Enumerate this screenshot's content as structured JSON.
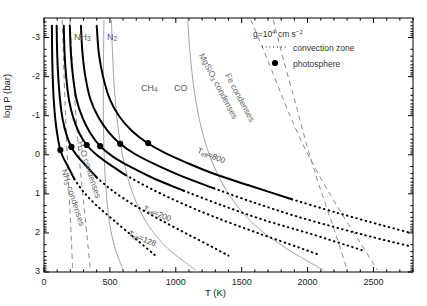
{
  "chart_data": {
    "type": "line",
    "title": "",
    "xlabel": "T (K)",
    "ylabel": "log P (bar)",
    "xlim": [
      0,
      2800
    ],
    "ylim": [
      -3.5,
      3.0
    ],
    "y_inverted": true,
    "grid": false,
    "xticks": [
      0,
      500,
      1000,
      1500,
      2000,
      2500
    ],
    "xticklabels": [
      "0",
      "500",
      "1000",
      "1500",
      "2000",
      "2500"
    ],
    "yticks": [
      -3,
      -2,
      -1,
      0,
      1,
      2,
      3
    ],
    "yticklabels": [
      "-3",
      "-2",
      "-1",
      "0",
      "1",
      "2",
      "3"
    ],
    "legend": {
      "position": "top-right",
      "gravity": "g=10⁴ cm s⁻²",
      "entries": [
        {
          "label": "convection zone",
          "style": "dotted",
          "color": "#000000"
        },
        {
          "label": "photosphere",
          "style": "marker-filled-circle",
          "color": "#000000"
        }
      ]
    },
    "series": [
      {
        "name": "T_eff=128 profile",
        "style": "solid+dotted",
        "label": "Tₑ꜀=128",
        "points": [
          [
            60,
            -3.3
          ],
          [
            62,
            -2.6
          ],
          [
            66,
            -2.0
          ],
          [
            74,
            -1.4
          ],
          [
            86,
            -0.9
          ],
          [
            104,
            -0.45
          ],
          [
            124,
            -0.12
          ],
          [
            150,
            0.1
          ],
          [
            182,
            0.3
          ],
          [
            230,
            0.62
          ],
          [
            300,
            0.95
          ],
          [
            400,
            1.3
          ],
          [
            520,
            1.65
          ],
          [
            660,
            2.05
          ],
          [
            800,
            2.45
          ],
          [
            860,
            2.62
          ]
        ],
        "photosphere": [
          124,
          -0.12
        ],
        "convection_start_index": 9
      },
      {
        "name": "T_eff=200 profile",
        "style": "solid+dotted",
        "label": "Tₑ꜀=200",
        "points": [
          [
            96,
            -3.3
          ],
          [
            100,
            -2.6
          ],
          [
            108,
            -2.0
          ],
          [
            122,
            -1.4
          ],
          [
            142,
            -0.9
          ],
          [
            172,
            -0.5
          ],
          [
            208,
            -0.2
          ],
          [
            250,
            0.02
          ],
          [
            310,
            0.25
          ],
          [
            400,
            0.58
          ],
          [
            520,
            0.92
          ],
          [
            680,
            1.28
          ],
          [
            880,
            1.66
          ],
          [
            1100,
            2.05
          ],
          [
            1310,
            2.42
          ],
          [
            1400,
            2.58
          ]
        ],
        "photosphere": [
          208,
          -0.2
        ],
        "convection_start_index": 9
      },
      {
        "name": "model profile 3",
        "style": "solid+dotted",
        "label": "",
        "points": [
          [
            150,
            -3.3
          ],
          [
            156,
            -2.6
          ],
          [
            168,
            -2.0
          ],
          [
            190,
            -1.4
          ],
          [
            222,
            -0.95
          ],
          [
            268,
            -0.55
          ],
          [
            324,
            -0.25
          ],
          [
            392,
            -0.02
          ],
          [
            486,
            0.22
          ],
          [
            620,
            0.52
          ],
          [
            800,
            0.85
          ],
          [
            1030,
            1.22
          ],
          [
            1300,
            1.6
          ],
          [
            1620,
            2.0
          ],
          [
            1940,
            2.38
          ],
          [
            2080,
            2.55
          ]
        ],
        "photosphere": [
          324,
          -0.25
        ],
        "convection_start_index": 9
      },
      {
        "name": "model profile 4",
        "style": "solid+dotted",
        "label": "",
        "points": [
          [
            196,
            -3.3
          ],
          [
            204,
            -2.6
          ],
          [
            220,
            -2.0
          ],
          [
            248,
            -1.4
          ],
          [
            292,
            -0.95
          ],
          [
            352,
            -0.55
          ],
          [
            426,
            -0.22
          ],
          [
            520,
            0.04
          ],
          [
            650,
            0.3
          ],
          [
            830,
            0.6
          ],
          [
            1060,
            0.92
          ],
          [
            1340,
            1.28
          ],
          [
            1660,
            1.66
          ],
          [
            2020,
            2.02
          ],
          [
            2300,
            2.32
          ],
          [
            2420,
            2.45
          ]
        ],
        "photosphere": [
          426,
          -0.22
        ],
        "convection_start_index": 10
      },
      {
        "name": "model profile 5",
        "style": "solid+dotted",
        "label": "",
        "points": [
          [
            280,
            -3.3
          ],
          [
            292,
            -2.6
          ],
          [
            314,
            -2.0
          ],
          [
            352,
            -1.42
          ],
          [
            410,
            -0.98
          ],
          [
            486,
            -0.6
          ],
          [
            578,
            -0.28
          ],
          [
            690,
            -0.02
          ],
          [
            840,
            0.24
          ],
          [
            1040,
            0.54
          ],
          [
            1290,
            0.86
          ],
          [
            1590,
            1.22
          ],
          [
            1920,
            1.58
          ],
          [
            2280,
            1.92
          ],
          [
            2580,
            2.18
          ],
          [
            2780,
            2.34
          ]
        ],
        "photosphere": [
          578,
          -0.28
        ],
        "convection_start_index": 10
      },
      {
        "name": "T_eff=800 profile",
        "style": "solid+dotted",
        "label": "Tₑ꜀=800",
        "points": [
          [
            400,
            -3.3
          ],
          [
            416,
            -2.6
          ],
          [
            448,
            -2.0
          ],
          [
            500,
            -1.42
          ],
          [
            572,
            -0.98
          ],
          [
            664,
            -0.62
          ],
          [
            776,
            -0.32
          ],
          [
            910,
            -0.06
          ],
          [
            1080,
            0.2
          ],
          [
            1300,
            0.5
          ],
          [
            1570,
            0.8
          ],
          [
            1880,
            1.14
          ],
          [
            2220,
            1.48
          ],
          [
            2560,
            1.8
          ],
          [
            2780,
            2.0
          ]
        ],
        "photosphere": [
          790,
          -0.3
        ],
        "convection_start_index": 11
      }
    ],
    "chem_boundaries": [
      {
        "label": "NH₃",
        "label_xy": [
          360,
          -3.05
        ],
        "color": "#9a9a9a",
        "points": [
          [
            455,
            -3.45
          ],
          [
            452,
            -2.6
          ],
          [
            450,
            -1.6
          ],
          [
            452,
            -0.6
          ],
          [
            460,
            0.3
          ],
          [
            476,
            1.1
          ],
          [
            500,
            1.8
          ],
          [
            540,
            2.4
          ],
          [
            600,
            2.95
          ]
        ]
      },
      {
        "label": "N₂",
        "label_xy": [
          560,
          -3.05
        ],
        "color": "#9a9a9a",
        "points": [
          [
            512,
            -3.45
          ],
          [
            520,
            -2.6
          ],
          [
            536,
            -1.6
          ],
          [
            566,
            -0.6
          ],
          [
            614,
            0.3
          ],
          [
            686,
            1.1
          ],
          [
            790,
            1.8
          ],
          [
            940,
            2.4
          ],
          [
            1150,
            2.95
          ]
        ]
      },
      {
        "label": "CH₄",
        "label_xy": [
          1010,
          -1.55
        ],
        "color": "#9a9a9a",
        "points": [
          [
            1090,
            -3.45
          ],
          [
            1108,
            -2.6
          ],
          [
            1142,
            -1.6
          ],
          [
            1200,
            -0.6
          ],
          [
            1290,
            0.3
          ],
          [
            1420,
            1.1
          ],
          [
            1600,
            1.8
          ],
          [
            1840,
            2.4
          ],
          [
            2120,
            2.95
          ]
        ]
      },
      {
        "label": "CO",
        "label_xy": [
          1250,
          -1.55
        ],
        "color": "#9a9a9a",
        "points": [
          [
            1090,
            -3.45
          ],
          [
            1108,
            -2.6
          ],
          [
            1142,
            -1.6
          ],
          [
            1200,
            -0.6
          ],
          [
            1290,
            0.3
          ],
          [
            1420,
            1.1
          ],
          [
            1600,
            1.8
          ],
          [
            1840,
            2.4
          ],
          [
            2120,
            2.95
          ]
        ]
      }
    ],
    "condensation_curves": [
      {
        "label": "NH₃ condenses",
        "style": "dashed",
        "color": "#8a8a8a",
        "points": [
          [
            138,
            -3.45
          ],
          [
            148,
            -2.4
          ],
          [
            160,
            -1.3
          ],
          [
            172,
            -0.3
          ],
          [
            184,
            0.6
          ],
          [
            196,
            1.4
          ],
          [
            208,
            2.2
          ],
          [
            218,
            2.95
          ]
        ]
      },
      {
        "label": "H₂O condenses",
        "style": "dashed",
        "color": "#8a8a8a",
        "points": [
          [
            196,
            -3.45
          ],
          [
            214,
            -2.4
          ],
          [
            236,
            -1.3
          ],
          [
            258,
            -0.3
          ],
          [
            282,
            0.6
          ],
          [
            306,
            1.4
          ],
          [
            330,
            2.2
          ],
          [
            352,
            2.95
          ]
        ]
      },
      {
        "label": "MgSiO₃ condenses",
        "style": "dashed",
        "color": "#8a8a8a",
        "points": [
          [
            1570,
            -3.45
          ],
          [
            1700,
            -2.4
          ],
          [
            1830,
            -1.3
          ],
          [
            1960,
            -0.3
          ],
          [
            2100,
            0.6
          ],
          [
            2240,
            1.4
          ],
          [
            2390,
            2.2
          ],
          [
            2530,
            2.95
          ]
        ]
      },
      {
        "label": "Fe condenses",
        "style": "dashed",
        "color": "#8a8a8a",
        "points": [
          [
            1740,
            -3.45
          ],
          [
            1820,
            -2.4
          ],
          [
            1910,
            -1.3
          ],
          [
            1990,
            -0.3
          ],
          [
            2070,
            0.6
          ],
          [
            2150,
            1.4
          ],
          [
            2230,
            2.2
          ],
          [
            2300,
            2.95
          ]
        ]
      }
    ],
    "annotations": [
      {
        "text": "NH₃",
        "kind": "molecule"
      },
      {
        "text": "N₂",
        "kind": "molecule"
      },
      {
        "text": "CH₄",
        "kind": "molecule"
      },
      {
        "text": "CO",
        "kind": "molecule"
      },
      {
        "text": "MgSiO₃ condenses",
        "kind": "condensation",
        "rotation": -62
      },
      {
        "text": "Fe condenses",
        "kind": "condensation",
        "rotation": -62
      },
      {
        "text": "H₂O condenses",
        "kind": "condensation",
        "rotation": -72
      },
      {
        "text": "NH₃ condenses",
        "kind": "condensation",
        "rotation": -72
      },
      {
        "text": "Tₑ꜀=800",
        "kind": "teff"
      },
      {
        "text": "Tₑ꜀=200",
        "kind": "teff"
      },
      {
        "text": "Tₑ꜀=128",
        "kind": "teff"
      }
    ]
  },
  "axes": {
    "x_label": "T (K)",
    "y_label": "log P (bar)",
    "x_ticklabels": [
      "0",
      "500",
      "1000",
      "1500",
      "2000",
      "2500"
    ],
    "y_ticklabels": [
      "-3",
      "-2",
      "-1",
      "0",
      "1",
      "2",
      "3"
    ]
  },
  "legend": {
    "gravity": "g=10",
    "gravity_exp": "4",
    "gravity_units": " cm s",
    "gravity_units_exp": "−2",
    "convection_label": "convection zone",
    "photosphere_label": "photosphere"
  },
  "molecules": {
    "nh3": "NH",
    "nh3_sub": "3",
    "n2": "N",
    "n2_sub": "2",
    "ch4": "CH",
    "ch4_sub": "4",
    "co": "CO"
  },
  "condensation": {
    "mgsio3": "MgSiO",
    "mgsio3_sub": "3",
    "mgsio3_rest": " condenses",
    "fe": "Fe condenses",
    "h2o": "H",
    "h2o_sub": "2",
    "h2o_rest": "O condenses",
    "nh3": "NH",
    "nh3_sub": "3",
    "nh3_rest": " condenses"
  },
  "teff": {
    "t": "T",
    "eff": "eff",
    "v800": "=800",
    "v200": "=200",
    "v128": "=128"
  },
  "colors": {
    "profile": "#000000",
    "chem": "#9a9a9a",
    "condensation": "#8a8a8a",
    "axis": "#000000"
  }
}
